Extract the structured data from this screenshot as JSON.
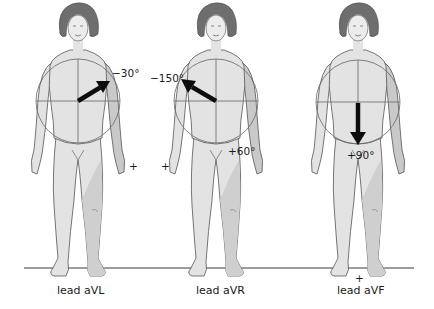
{
  "diagram": {
    "ground_line": {
      "color": "#3a3a3a"
    },
    "colors": {
      "body_light": "#e3e3e3",
      "body_shade": "#c9c9c9",
      "hair": "#6e6e6e",
      "outline": "#555555",
      "axis": "#666666",
      "arrow": "#0d0d0d"
    },
    "figures": [
      {
        "id": "aVL",
        "caption": "lead aVL",
        "angle_label": "−30°",
        "angle_degrees": -30,
        "plus_marker": "+"
      },
      {
        "id": "aVR",
        "caption": "lead aVR",
        "angle_label": "−150°",
        "angle_degrees": -150,
        "secondary_label": "+60°",
        "plus_marker": "+"
      },
      {
        "id": "aVF",
        "caption": "lead aVF",
        "angle_label": "+90°",
        "angle_degrees": 90,
        "plus_marker": "+"
      }
    ]
  }
}
